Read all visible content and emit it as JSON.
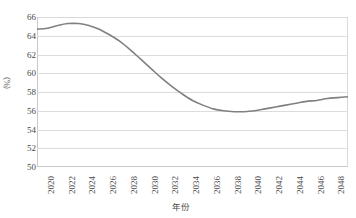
{
  "chart_data": {
    "type": "line",
    "title": "",
    "xlabel": "年份",
    "ylabel": "（%）",
    "ylim": [
      50,
      66
    ],
    "xlim": [
      2020,
      2050
    ],
    "ytick_step": 2,
    "grid": true,
    "legend": false,
    "line_color": "#808080",
    "grid_color": "#dcdcdc",
    "axis_color": "#c9c9c9",
    "yticks": [
      "66",
      "64",
      "62",
      "60",
      "58",
      "56",
      "54",
      "52",
      "50"
    ],
    "xticks": [
      "2020",
      "2022",
      "2024",
      "2026",
      "2028",
      "2030",
      "2032",
      "2034",
      "2036",
      "2038",
      "2040",
      "2042",
      "2044",
      "2046",
      "2048",
      "2050"
    ],
    "x": [
      2020,
      2021,
      2022,
      2023,
      2024,
      2025,
      2026,
      2027,
      2028,
      2029,
      2030,
      2031,
      2032,
      2033,
      2034,
      2035,
      2036,
      2037,
      2038,
      2039,
      2040,
      2041,
      2042,
      2043,
      2044,
      2045,
      2046,
      2047,
      2048,
      2049,
      2050
    ],
    "values": [
      64.7,
      64.8,
      65.1,
      65.3,
      65.3,
      65.1,
      64.7,
      64.1,
      63.4,
      62.5,
      61.5,
      60.5,
      59.5,
      58.6,
      57.8,
      57.1,
      56.6,
      56.2,
      56.0,
      55.9,
      55.9,
      56.0,
      56.2,
      56.4,
      56.6,
      56.8,
      57.0,
      57.1,
      57.3,
      57.4,
      57.5
    ],
    "series": [
      {
        "name": "占比",
        "values": [
          64.7,
          64.8,
          65.1,
          65.3,
          65.3,
          65.1,
          64.7,
          64.1,
          63.4,
          62.5,
          61.5,
          60.5,
          59.5,
          58.6,
          57.8,
          57.1,
          56.6,
          56.2,
          56.0,
          55.9,
          55.9,
          56.0,
          56.2,
          56.4,
          56.6,
          56.8,
          57.0,
          57.1,
          57.3,
          57.4,
          57.5
        ]
      }
    ]
  }
}
